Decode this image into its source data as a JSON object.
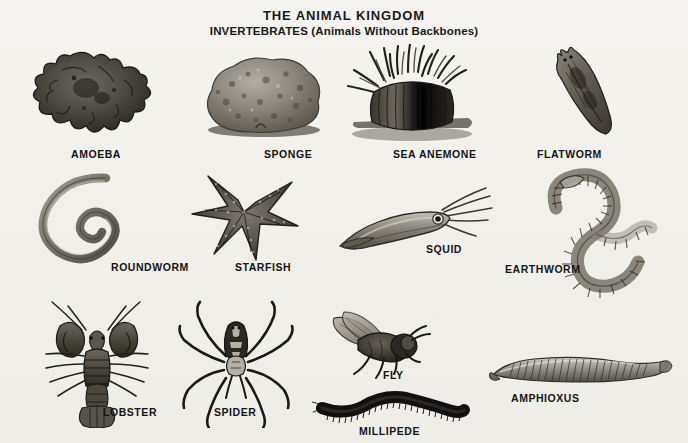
{
  "poster": {
    "title_main": "THE ANIMAL KINGDOM",
    "title_sub": "INVERTEBRATES (Animals Without Backbones)",
    "background_color": "#f2f0eb",
    "ink_color": "#141414",
    "style": "black-and-white engraved scientific illustrations"
  },
  "specimens": [
    {
      "label": "AMOEBA",
      "icon": "amoeba-icon",
      "row": 1,
      "column": 1
    },
    {
      "label": "SPONGE",
      "icon": "sponge-icon",
      "row": 1,
      "column": 2
    },
    {
      "label": "SEA ANEMONE",
      "icon": "sea-anemone-icon",
      "row": 1,
      "column": 3
    },
    {
      "label": "FLATWORM",
      "icon": "flatworm-icon",
      "row": 1,
      "column": 4
    },
    {
      "label": "ROUNDWORM",
      "icon": "roundworm-icon",
      "row": 2,
      "column": 1
    },
    {
      "label": "STARFISH",
      "icon": "starfish-icon",
      "row": 2,
      "column": 2
    },
    {
      "label": "SQUID",
      "icon": "squid-icon",
      "row": 2,
      "column": 3
    },
    {
      "label": "EARTHWORM",
      "icon": "earthworm-icon",
      "row": 2,
      "column": 4
    },
    {
      "label": "LOBSTER",
      "icon": "lobster-icon",
      "row": 3,
      "column": 1
    },
    {
      "label": "SPIDER",
      "icon": "spider-icon",
      "row": 3,
      "column": 2
    },
    {
      "label": "FLY",
      "icon": "fly-icon",
      "row": 3,
      "column": 3
    },
    {
      "label": "MILLIPEDE",
      "icon": "millipede-icon",
      "row": 3,
      "column": 3
    },
    {
      "label": "AMPHIOXUS",
      "icon": "amphioxus-icon",
      "row": 3,
      "column": 4
    }
  ]
}
